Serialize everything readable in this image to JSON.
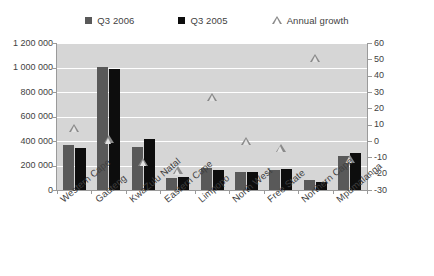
{
  "legend": {
    "items": [
      {
        "label": "Q3 2006",
        "marker": "square-swatch-icon",
        "color": "#595959"
      },
      {
        "label": "Q3 2005",
        "marker": "square-swatch-icon",
        "color": "#0d0d0d"
      },
      {
        "label": "Annual growth",
        "marker": "triangle-marker-icon",
        "color": "#8a8a8a"
      }
    ]
  },
  "axes": {
    "left_ticks": [
      "1 200 000",
      "1 000 000",
      "800 000",
      "600 000",
      "400 000",
      "200 000",
      "0"
    ],
    "right_ticks": [
      "60",
      "50",
      "40",
      "30",
      "20",
      "10",
      "0",
      "-10",
      "-20",
      "-30"
    ]
  },
  "chart_data": {
    "type": "bar",
    "title": "",
    "xlabel": "",
    "ylabel": "",
    "categories": [
      "Western Cape",
      "Gauteng",
      "KwaZulu Natal",
      "Eastern Cape",
      "Limpopo",
      "North West",
      "Free State",
      "Northern Cape",
      "Mpumalanga"
    ],
    "series": [
      {
        "name": "Q3 2006",
        "axis": "left",
        "color": "#595959",
        "values": [
          370000,
          1005000,
          350000,
          95000,
          180000,
          150000,
          165000,
          78000,
          280000
        ]
      },
      {
        "name": "Q3 2005",
        "axis": "left",
        "color": "#0d0d0d",
        "values": [
          340000,
          985000,
          420000,
          110000,
          160000,
          150000,
          175000,
          65000,
          300000
        ]
      },
      {
        "name": "Annual growth",
        "axis": "right",
        "type": "scatter",
        "marker": "triangle",
        "color": "#8a8a8a",
        "values": [
          8,
          1,
          -13,
          -18,
          27,
          0,
          -4,
          51,
          -11
        ]
      }
    ],
    "ylim": [
      0,
      1200000
    ],
    "y2lim": [
      -30,
      60
    ],
    "ytick_step": 200000,
    "y2tick_step": 10,
    "grid": true,
    "grid_color": "#ffffff",
    "plot_background": "#d6d6d6",
    "legend_position": "top"
  }
}
